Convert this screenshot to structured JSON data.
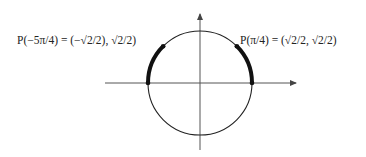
{
  "diagram": {
    "type": "unit-circle",
    "center": [
      200,
      82
    ],
    "radius": 52,
    "points": [
      {
        "name": "P(π/4)",
        "label": "P(π/4) = (√2/2, √2/2)",
        "angle_deg": 45
      },
      {
        "name": "P(-5π/4)",
        "label": "P(−5π/4) = (−√2/2), √2/2)",
        "angle_deg": 135
      }
    ],
    "highlighted_arcs": [
      {
        "from_deg": 0,
        "to_deg": 45
      },
      {
        "from_deg": 135,
        "to_deg": 180
      }
    ],
    "colors": {
      "stroke": "#111111",
      "axis": "#444444"
    }
  }
}
